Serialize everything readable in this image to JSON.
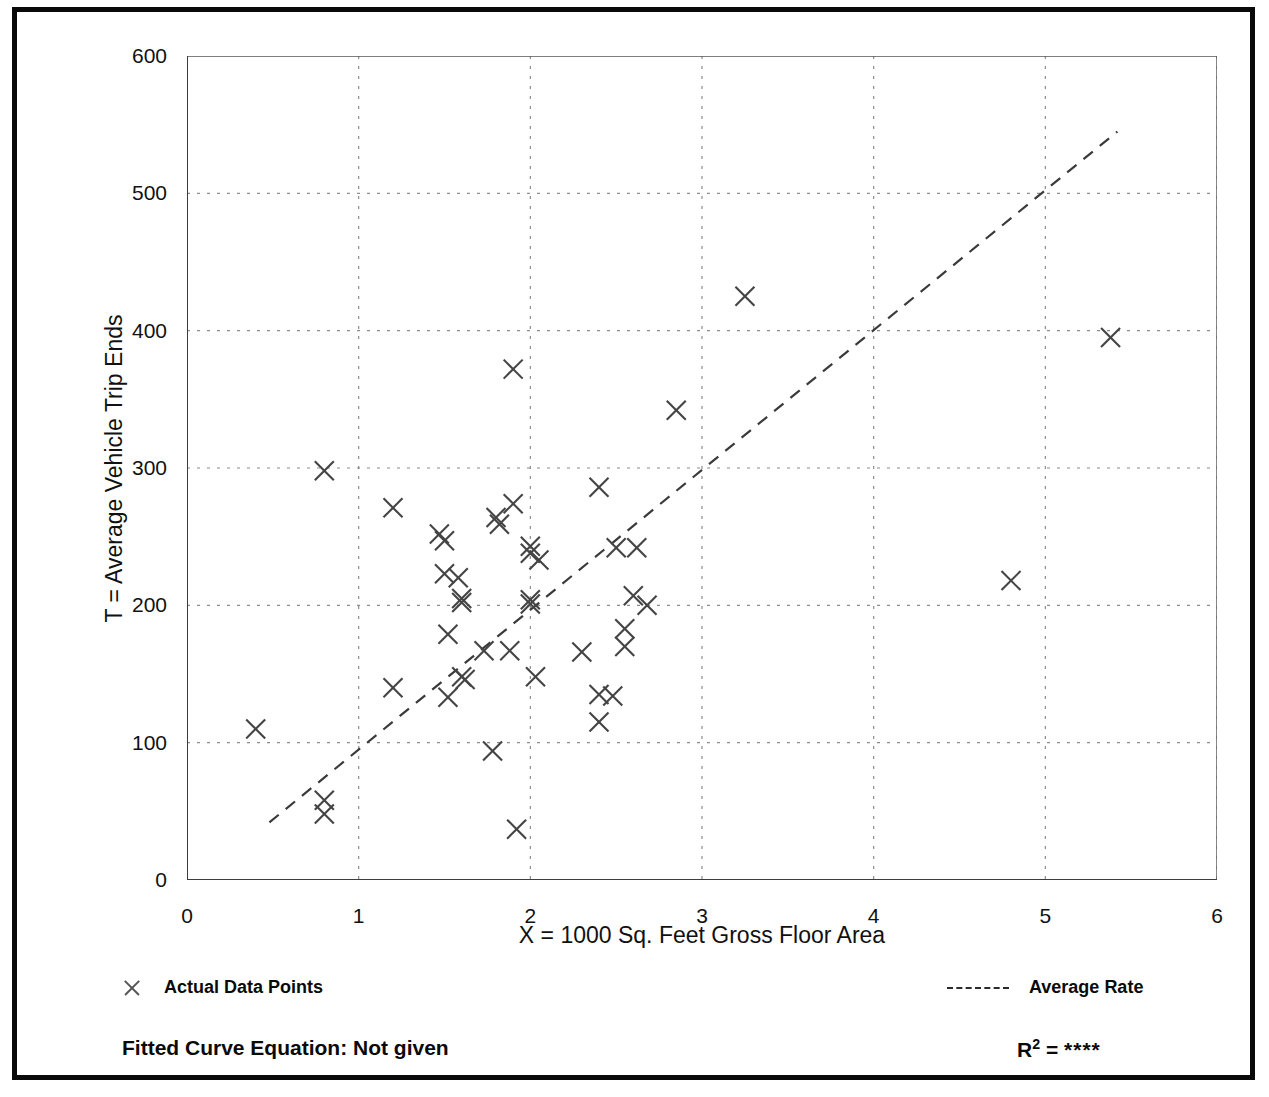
{
  "chart_data": {
    "type": "scatter",
    "title": "",
    "xlabel": "X = 1000 Sq. Feet Gross Floor Area",
    "ylabel": "T = Average Vehicle Trip Ends",
    "xlim": [
      0,
      6
    ],
    "ylim": [
      0,
      600
    ],
    "xticks": [
      0,
      1,
      2,
      3,
      4,
      5,
      6
    ],
    "yticks": [
      0,
      100,
      200,
      300,
      400,
      500,
      600
    ],
    "xtick_labels": [
      "0",
      "1",
      "2",
      "3",
      "4",
      "5",
      "6"
    ],
    "ytick_labels": [
      "0",
      "100",
      "200",
      "300",
      "400",
      "500",
      "600"
    ],
    "x_minor_step": 0.5,
    "y_minor_step": 50,
    "grid": true,
    "grid_style": "dotted",
    "legend_position": "below-plot",
    "series": [
      {
        "name": "Actual Data Points",
        "marker": "x",
        "color": "#444444",
        "points": [
          [
            0.4,
            110
          ],
          [
            0.8,
            298
          ],
          [
            0.8,
            58
          ],
          [
            0.8,
            48
          ],
          [
            1.2,
            271
          ],
          [
            1.2,
            140
          ],
          [
            1.47,
            252
          ],
          [
            1.5,
            247
          ],
          [
            1.5,
            223
          ],
          [
            1.52,
            133
          ],
          [
            1.58,
            220
          ],
          [
            1.6,
            205
          ],
          [
            1.6,
            202
          ],
          [
            1.6,
            148
          ],
          [
            1.62,
            146
          ],
          [
            1.52,
            179
          ],
          [
            1.73,
            167
          ],
          [
            1.8,
            264
          ],
          [
            1.82,
            259
          ],
          [
            1.78,
            94
          ],
          [
            1.9,
            372
          ],
          [
            1.9,
            274
          ],
          [
            1.88,
            167
          ],
          [
            1.92,
            37
          ],
          [
            2.0,
            243
          ],
          [
            2.0,
            238
          ],
          [
            2.05,
            233
          ],
          [
            2.0,
            204
          ],
          [
            2.0,
            201
          ],
          [
            2.03,
            148
          ],
          [
            2.3,
            166
          ],
          [
            2.4,
            286
          ],
          [
            2.4,
            135
          ],
          [
            2.4,
            115
          ],
          [
            2.48,
            134
          ],
          [
            2.5,
            242
          ],
          [
            2.55,
            183
          ],
          [
            2.55,
            170
          ],
          [
            2.6,
            207
          ],
          [
            2.62,
            242
          ],
          [
            2.68,
            200
          ],
          [
            2.85,
            342
          ],
          [
            3.25,
            425
          ],
          [
            4.8,
            218
          ],
          [
            5.38,
            395
          ]
        ]
      }
    ],
    "trendline": {
      "name": "Average Rate",
      "style": "dashed",
      "color": "#3a3a3a",
      "x_start": 0.48,
      "y_start": 42,
      "x_end": 5.42,
      "y_end": 545
    }
  },
  "legend": {
    "data_points_label": "Actual Data Points",
    "data_points_marker": "x-marker-icon",
    "average_rate_label": "Average Rate",
    "average_rate_marker": "dashed-line-icon"
  },
  "footer": {
    "equation_label": "Fitted Curve Equation:  Not given",
    "r2_prefix": "R",
    "r2_exponent": "2",
    "r2_equals": " = ",
    "r2_value": "****"
  }
}
